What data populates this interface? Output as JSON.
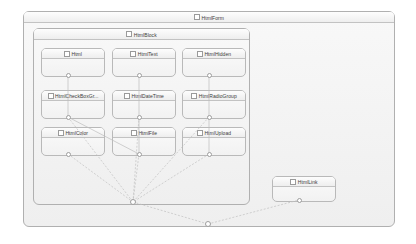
{
  "diagram": {
    "type": "uml-class-diagram",
    "background": "#ffffff",
    "node_fill": "#f5f5f5",
    "node_border": "#b9b9b9",
    "link_color": "#c0c0c0"
  },
  "containers": [
    {
      "id": "htmlform",
      "label": "HtmlForm",
      "icon": "class-checkbox-icon",
      "x": 23,
      "y": 11,
      "w": 372,
      "h": 216
    },
    {
      "id": "htmlblock",
      "label": "HtmlBlock",
      "icon": "class-checkbox-icon",
      "x": 33,
      "y": 28,
      "w": 217,
      "h": 177
    }
  ],
  "nodes": [
    {
      "id": "html",
      "label": "Html",
      "icon": "class-checkbox-icon",
      "x": 41,
      "y": 48,
      "w": 64,
      "h": 29
    },
    {
      "id": "htmltext",
      "label": "HtmlText",
      "icon": "class-checkbox-icon",
      "x": 112,
      "y": 48,
      "w": 64,
      "h": 29
    },
    {
      "id": "htmlhidden",
      "label": "HtmlHidden",
      "icon": "class-checkbox-icon",
      "x": 182,
      "y": 48,
      "w": 64,
      "h": 29
    },
    {
      "id": "htmlcheckboxgr",
      "label": "HtmlCheckBoxGr...",
      "icon": "class-checkbox-icon",
      "x": 41,
      "y": 90,
      "w": 64,
      "h": 29
    },
    {
      "id": "htmldatetime",
      "label": "HtmlDateTime",
      "icon": "class-checkbox-icon",
      "x": 112,
      "y": 90,
      "w": 64,
      "h": 29
    },
    {
      "id": "htmlradiogroup",
      "label": "HtmlRadioGroup",
      "icon": "class-checkbox-icon",
      "x": 182,
      "y": 90,
      "w": 64,
      "h": 29
    },
    {
      "id": "htmlcolor",
      "label": "HtmlColor",
      "icon": "class-checkbox-icon",
      "x": 41,
      "y": 127,
      "w": 64,
      "h": 29
    },
    {
      "id": "htmlfile",
      "label": "HtmlFile",
      "icon": "class-checkbox-icon",
      "x": 112,
      "y": 127,
      "w": 64,
      "h": 29
    },
    {
      "id": "htmlupload",
      "label": "HtmlUpload",
      "icon": "class-checkbox-icon",
      "x": 182,
      "y": 127,
      "w": 64,
      "h": 29
    },
    {
      "id": "htmllink",
      "label": "HtmlLink",
      "icon": "class-checkbox-icon",
      "x": 272,
      "y": 176,
      "w": 64,
      "h": 26
    }
  ],
  "ports": [
    {
      "id": "p-html",
      "owner": "html",
      "x": 68,
      "y": 75
    },
    {
      "id": "p-htmltext",
      "owner": "htmltext",
      "x": 139,
      "y": 75
    },
    {
      "id": "p-htmlhidden",
      "owner": "htmlhidden",
      "x": 209,
      "y": 75
    },
    {
      "id": "p-htmlcheckbox",
      "owner": "htmlcheckboxgr",
      "x": 68,
      "y": 117
    },
    {
      "id": "p-htmldatetime",
      "owner": "htmldatetime",
      "x": 139,
      "y": 117
    },
    {
      "id": "p-htmlradiogroup",
      "owner": "htmlradiogroup",
      "x": 209,
      "y": 117
    },
    {
      "id": "p-htmlcolor",
      "owner": "htmlcolor",
      "x": 68,
      "y": 154
    },
    {
      "id": "p-htmlfile",
      "owner": "htmlfile",
      "x": 139,
      "y": 154
    },
    {
      "id": "p-htmlupload",
      "owner": "htmlupload",
      "x": 209,
      "y": 154
    },
    {
      "id": "p-htmllink",
      "owner": "htmllink",
      "x": 299,
      "y": 200
    }
  ],
  "hubs": [
    {
      "id": "hub-block",
      "label": "",
      "x": 133,
      "y": 202
    },
    {
      "id": "hub-form",
      "label": "",
      "x": 208,
      "y": 224
    }
  ],
  "links": [
    {
      "from": "p-html",
      "to": "p-htmlcheckbox",
      "style": "solid"
    },
    {
      "from": "p-htmltext",
      "to": "p-htmldatetime",
      "style": "solid"
    },
    {
      "from": "p-htmlhidden",
      "to": "p-htmlradiogroup",
      "style": "solid"
    },
    {
      "from": "p-htmlcheckbox",
      "to": "p-htmlfile",
      "style": "solid"
    },
    {
      "from": "p-htmldatetime",
      "to": "p-htmlfile",
      "style": "solid"
    },
    {
      "from": "p-htmlradiogroup",
      "to": "p-htmlupload",
      "style": "solid"
    },
    {
      "from": "p-htmlcolor",
      "to": "hub-block",
      "style": "dashed"
    },
    {
      "from": "p-htmlfile",
      "to": "hub-block",
      "style": "dashed"
    },
    {
      "from": "p-htmlupload",
      "to": "hub-block",
      "style": "dashed"
    },
    {
      "from": "p-htmlcheckbox",
      "to": "hub-block",
      "style": "dashed"
    },
    {
      "from": "p-htmldatetime",
      "to": "hub-block",
      "style": "dashed"
    },
    {
      "from": "p-htmlradiogroup",
      "to": "hub-block",
      "style": "dashed"
    },
    {
      "from": "hub-block",
      "to": "hub-form",
      "style": "dashed"
    },
    {
      "from": "hub-form",
      "to": "p-htmllink",
      "style": "dashed"
    }
  ]
}
